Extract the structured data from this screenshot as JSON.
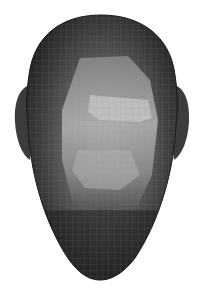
{
  "scene": {
    "subject": "3D mesh head render",
    "background": "#ffffff",
    "colors": {
      "mesh_dark": "#2a2a2a",
      "mesh_mid": "#555555",
      "mesh_light": "#a8a8a8",
      "highlight": "#c8c8c8",
      "wire": "#777777"
    }
  }
}
